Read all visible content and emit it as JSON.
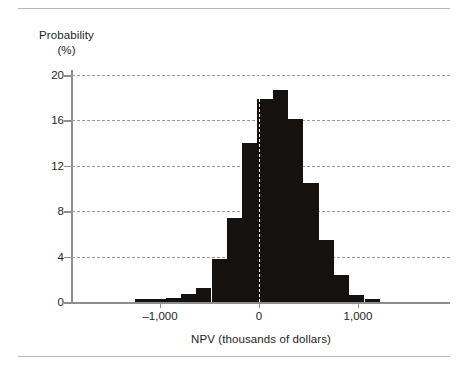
{
  "figure": {
    "has_top_rule": true,
    "has_bottom_rule": true,
    "background_color": "#ffffff",
    "bar_color": "#15110f",
    "axis_color": "#8e8e8e",
    "gridline_color": "#9a9a9a",
    "zero_reference_line_color": "#ffffff"
  },
  "chart_data": {
    "type": "bar",
    "title": "",
    "subtitle": "",
    "xlabel": "NPV (thousands of dollars)",
    "ylabel": "Probability\n(%)",
    "ylabel_line1": "Probability",
    "ylabel_line2": "(%)",
    "ylim": [
      0,
      20
    ],
    "xlim": [
      -1400,
      1400
    ],
    "yticks": [
      0,
      4,
      8,
      12,
      16,
      20
    ],
    "ytick_labels": [
      "0",
      "4",
      "8",
      "12",
      "16",
      "20"
    ],
    "xticks": [
      -1000,
      0,
      1000
    ],
    "xtick_labels": [
      "–1,000",
      "0",
      "1,000"
    ],
    "grid": "horizontal-dashed",
    "legend": null,
    "legend_position": "none",
    "annotations": [
      {
        "name": "zero-reference-line",
        "x": 0,
        "style": "white-dashed-vertical"
      }
    ],
    "bin_width": 150,
    "bin_centers": [
      -1025,
      -875,
      -725,
      -575,
      -425,
      -275,
      -125,
      25,
      175,
      325,
      475,
      625,
      775,
      925,
      1075,
      1225
    ],
    "categories": [
      "-1100",
      "-950",
      "-800",
      "-650",
      "-500",
      "-350",
      "-200",
      "-50",
      "100",
      "250",
      "400",
      "550",
      "700",
      "850",
      "1000",
      "1150"
    ],
    "values": [
      0.25,
      0.3,
      0.35,
      0.75,
      1.25,
      3.8,
      7.4,
      14.0,
      17.9,
      18.7,
      16.1,
      10.5,
      5.5,
      2.4,
      0.6,
      0.3
    ],
    "bars": [
      {
        "label": "-1100",
        "value": 0.25,
        "left_px": 135.0,
        "width_px": 15.3
      },
      {
        "label": "-950",
        "value": 0.3,
        "left_px": 150.3,
        "width_px": 15.3
      },
      {
        "label": "-800",
        "value": 0.35,
        "left_px": 165.6,
        "width_px": 15.3
      },
      {
        "label": "-650",
        "value": 0.75,
        "left_px": 180.9,
        "width_px": 15.3
      },
      {
        "label": "-500",
        "value": 1.25,
        "left_px": 196.2,
        "width_px": 15.3
      },
      {
        "label": "-350",
        "value": 3.8,
        "left_px": 211.5,
        "width_px": 15.3
      },
      {
        "label": "-200",
        "value": 7.4,
        "left_px": 226.8,
        "width_px": 15.3
      },
      {
        "label": "-50",
        "value": 14.0,
        "left_px": 242.1,
        "width_px": 15.3
      },
      {
        "label": "100",
        "value": 17.9,
        "left_px": 257.4,
        "width_px": 15.3
      },
      {
        "label": "250",
        "value": 18.7,
        "left_px": 272.7,
        "width_px": 15.3
      },
      {
        "label": "400",
        "value": 16.1,
        "left_px": 288.0,
        "width_px": 15.3
      },
      {
        "label": "550",
        "value": 10.5,
        "left_px": 303.3,
        "width_px": 15.3
      },
      {
        "label": "700",
        "value": 5.5,
        "left_px": 318.6,
        "width_px": 15.3
      },
      {
        "label": "850",
        "value": 2.4,
        "left_px": 333.9,
        "width_px": 15.3
      },
      {
        "label": "1000",
        "value": 0.6,
        "left_px": 349.2,
        "width_px": 15.3
      },
      {
        "label": "1150",
        "value": 0.3,
        "left_px": 364.5,
        "width_px": 15.3
      }
    ]
  }
}
